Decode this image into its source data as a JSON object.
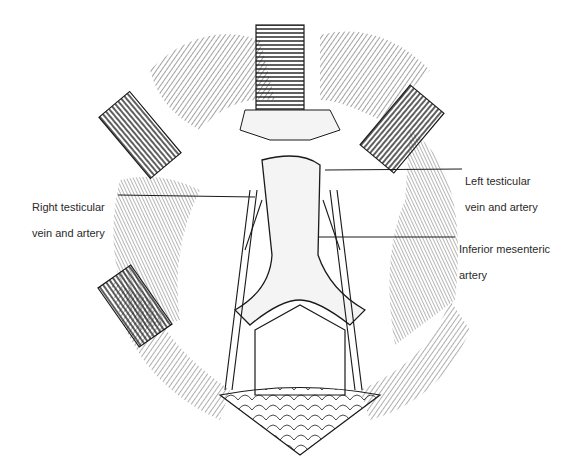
{
  "figure": {
    "labels": {
      "right_testicular": {
        "line1": "Right testicular",
        "line2": "vein and artery"
      },
      "left_testicular": {
        "line1": "Left testicular",
        "line2": "vein and artery"
      },
      "inferior_mesenteric": {
        "line1": "Inferior mesenteric",
        "line2": "artery"
      }
    },
    "colors": {
      "ink": "#1a1a1a",
      "background": "#ffffff",
      "vessel_fill": "#f4f4f4"
    }
  }
}
